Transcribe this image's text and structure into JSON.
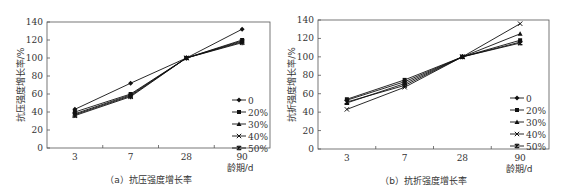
{
  "chart_data": [
    {
      "type": "line",
      "title": "",
      "caption": "（a）抗压强度增长率",
      "xlabel": "龄期/d",
      "ylabel": "抗压强度增长率/%",
      "categories": [
        "3",
        "7",
        "28",
        "90"
      ],
      "ylim": [
        0,
        140
      ],
      "yticks": [
        0,
        20,
        40,
        60,
        80,
        100,
        120,
        140
      ],
      "grid": false,
      "legend_position": "right-bottom inside",
      "series": [
        {
          "name": "0",
          "marker": "diamond",
          "values": [
            43,
            72,
            100,
            132
          ]
        },
        {
          "name": "20%",
          "marker": "square",
          "values": [
            40,
            60,
            100,
            120
          ]
        },
        {
          "name": "30%",
          "marker": "triangle",
          "values": [
            38,
            59,
            100,
            119
          ]
        },
        {
          "name": "40%",
          "marker": "x",
          "values": [
            37,
            58,
            100,
            118
          ]
        },
        {
          "name": "50%",
          "marker": "star",
          "values": [
            36,
            57,
            100,
            117
          ]
        }
      ]
    },
    {
      "type": "line",
      "title": "",
      "caption": "（b）抗折强度增长率",
      "xlabel": "龄期/d",
      "ylabel": "抗折强度增长率/%",
      "categories": [
        "3",
        "7",
        "28",
        "90"
      ],
      "ylim": [
        0,
        140
      ],
      "yticks": [
        0,
        20,
        40,
        60,
        80,
        100,
        120,
        140
      ],
      "grid": false,
      "legend_position": "right-bottom inside",
      "series": [
        {
          "name": "0",
          "marker": "diamond",
          "values": [
            53,
            73,
            100,
            116
          ]
        },
        {
          "name": "20%",
          "marker": "square",
          "values": [
            54,
            75,
            100,
            118
          ]
        },
        {
          "name": "30%",
          "marker": "triangle",
          "values": [
            50,
            71,
            100,
            125
          ]
        },
        {
          "name": "40%",
          "marker": "x",
          "values": [
            43,
            67,
            100,
            136
          ]
        },
        {
          "name": "50%",
          "marker": "star",
          "values": [
            51,
            69,
            100,
            115
          ]
        }
      ]
    }
  ]
}
